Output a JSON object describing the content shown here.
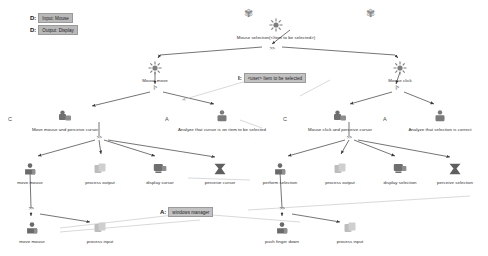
{
  "diagram": {
    "legend": [
      {
        "key": "D:",
        "value": "Input: Mouse",
        "name": "legend-input-mouse"
      },
      {
        "key": "D:",
        "value": "Output: Display",
        "name": "legend-output-display"
      }
    ],
    "annotations": [
      {
        "key": "I:",
        "value": "<user> Item to be selected",
        "name": "annotation-item-to-be-selected"
      },
      {
        "key": "A:",
        "value": "windows manager",
        "name": "annotation-windows-manager"
      }
    ],
    "operators": [
      {
        "symbol": ">>",
        "name": "operator-sequence-root"
      },
      {
        "symbol": "|>",
        "name": "operator-order-independence-move"
      },
      {
        "symbol": "|>",
        "name": "operator-order-independence-click"
      },
      {
        "symbol": ">>",
        "name": "operator-sequence-move-cursor"
      },
      {
        "symbol": ">>",
        "name": "operator-sequence-click-cursor"
      },
      {
        "symbol": ">>",
        "name": "operator-sequence-move-mouse"
      },
      {
        "symbol": ">>",
        "name": "operator-sequence-push-finger"
      }
    ],
    "nodes": [
      {
        "id": "root",
        "label": "Mouse selection(<Item to be selected>)",
        "glyph": "abstract",
        "badge": "",
        "x": 276,
        "y": 18,
        "wide": true,
        "name": "node-mouse-selection"
      },
      {
        "id": "mousemove",
        "label": "Mouse move",
        "glyph": "abstract",
        "badge": "",
        "x": 155,
        "y": 61,
        "wide": false,
        "name": "node-mouse-move"
      },
      {
        "id": "mouseclick",
        "label": "Mouse click",
        "glyph": "abstract",
        "badge": "",
        "x": 400,
        "y": 61,
        "wide": false,
        "name": "node-mouse-click"
      },
      {
        "id": "movepercv",
        "label": "Move mouse and perceive cursor",
        "glyph": "interactive",
        "badge": "C",
        "x": 65,
        "y": 110,
        "wide": true,
        "name": "node-move-mouse-and-perceive-cursor"
      },
      {
        "id": "analyzecur",
        "label": "Analyze that cursor is on item to be selected",
        "glyph": "cognitive",
        "badge": "A",
        "x": 222,
        "y": 110,
        "wide": true,
        "name": "node-analyze-cursor-on-item"
      },
      {
        "id": "clickpercv",
        "label": "Mouse click and perceive cursor",
        "glyph": "interactive",
        "badge": "C",
        "x": 340,
        "y": 110,
        "wide": true,
        "name": "node-mouse-click-and-perceive-cursor"
      },
      {
        "id": "analyzesel",
        "label": "Analyze that selection is correct",
        "glyph": "cognitive",
        "badge": "A",
        "x": 440,
        "y": 110,
        "wide": true,
        "name": "node-analyze-selection-correct"
      },
      {
        "id": "movemouse1",
        "label": "move mouse",
        "glyph": "motor",
        "badge": "",
        "x": 30,
        "y": 163,
        "wide": false,
        "name": "node-move-mouse-1"
      },
      {
        "id": "procout1",
        "label": "process output",
        "glyph": "system",
        "badge": "",
        "x": 100,
        "y": 163,
        "wide": false,
        "name": "node-process-output-1"
      },
      {
        "id": "dispcursor",
        "label": "display cursor",
        "glyph": "display",
        "badge": "",
        "x": 160,
        "y": 163,
        "wide": false,
        "name": "node-display-cursor"
      },
      {
        "id": "perccursor",
        "label": "perceive cursor",
        "glyph": "perceive",
        "badge": "",
        "x": 220,
        "y": 163,
        "wide": false,
        "name": "node-perceive-cursor"
      },
      {
        "id": "perfsel",
        "label": "perform selection",
        "glyph": "motor",
        "badge": "",
        "x": 280,
        "y": 163,
        "wide": false,
        "name": "node-perform-selection"
      },
      {
        "id": "procout2",
        "label": "process output",
        "glyph": "system",
        "badge": "",
        "x": 340,
        "y": 163,
        "wide": false,
        "name": "node-process-output-2"
      },
      {
        "id": "dispsel",
        "label": "display selection",
        "glyph": "display",
        "badge": "",
        "x": 400,
        "y": 163,
        "wide": false,
        "name": "node-display-selection"
      },
      {
        "id": "percsel",
        "label": "perceive selection",
        "glyph": "perceive",
        "badge": "",
        "x": 455,
        "y": 163,
        "wide": false,
        "name": "node-perceive-selection"
      },
      {
        "id": "movemouse2",
        "label": "move mouse",
        "glyph": "motor",
        "badge": "",
        "x": 32,
        "y": 222,
        "wide": false,
        "name": "node-move-mouse-2"
      },
      {
        "id": "procin1",
        "label": "process input",
        "glyph": "system",
        "badge": "",
        "x": 100,
        "y": 222,
        "wide": false,
        "name": "node-process-input-1"
      },
      {
        "id": "pushfinger",
        "label": "push finger down",
        "glyph": "motor",
        "badge": "",
        "x": 282,
        "y": 222,
        "wide": false,
        "name": "node-push-finger-down"
      },
      {
        "id": "procin2",
        "label": "process input",
        "glyph": "system",
        "badge": "",
        "x": 350,
        "y": 222,
        "wide": false,
        "name": "node-process-input-2"
      }
    ],
    "decorations": [
      {
        "symbol": "✾",
        "x": 248,
        "y": 9,
        "size": 9,
        "name": "puzzle-icon-left"
      },
      {
        "symbol": "✾",
        "x": 370,
        "y": 9,
        "size": 9,
        "name": "puzzle-icon-right"
      }
    ],
    "colors": {
      "edge": "#3a3a3a",
      "faint_edge": "#c9c9c9",
      "chip_bg": "#b9b9b9",
      "text": "#2f2f2f"
    }
  }
}
